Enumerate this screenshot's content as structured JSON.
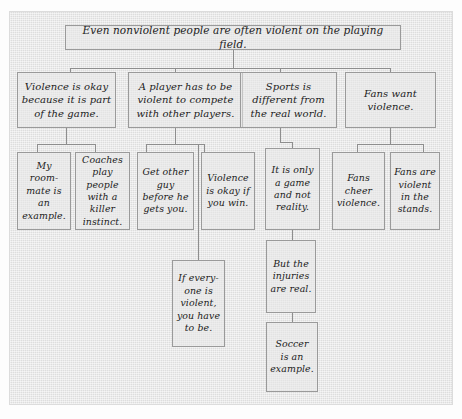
{
  "diagram": {
    "title_node": {
      "id": "root",
      "text": "Even nonviolent people are often violent on the playing field."
    },
    "level2": [
      {
        "id": "l2-1",
        "text": "Violence is okay because it is part of the game."
      },
      {
        "id": "l2-2",
        "text": "A player has to be violent to compete with other players."
      },
      {
        "id": "l2-3",
        "text": "Sports is different from the real world."
      },
      {
        "id": "l2-4",
        "text": "Fans want violence."
      }
    ],
    "level3": [
      {
        "id": "l3-1",
        "parent": "l2-1",
        "text": "My room-mate is an example."
      },
      {
        "id": "l3-2",
        "parent": "l2-1",
        "text": "Coaches play people with a killer instinct."
      },
      {
        "id": "l3-3",
        "parent": "l2-2",
        "text": "Get other guy before he gets you."
      },
      {
        "id": "l3-4",
        "parent": "l2-2",
        "text": "Violence is okay if you win."
      },
      {
        "id": "l3-5",
        "parent": "l2-3",
        "text": "It is only a game and not reality."
      },
      {
        "id": "l3-6",
        "parent": "l2-4",
        "text": "Fans cheer violence."
      },
      {
        "id": "l3-7",
        "parent": "l2-4",
        "text": "Fans are violent in the stands."
      }
    ],
    "level4": [
      {
        "id": "l4-1",
        "parent": "l2-2",
        "text": "If every-one is violent, you have to be."
      },
      {
        "id": "l4-2",
        "parent": "l3-5",
        "text": "But the injuries are real."
      }
    ],
    "level5": [
      {
        "id": "l5-1",
        "parent": "l4-2",
        "text": "Soccer is an example."
      }
    ],
    "colors": {
      "panel_background": "#e2e2e2",
      "box_border": "#9a9a9a",
      "connector": "#8e8e8e",
      "text": "#1b1b1b"
    }
  }
}
